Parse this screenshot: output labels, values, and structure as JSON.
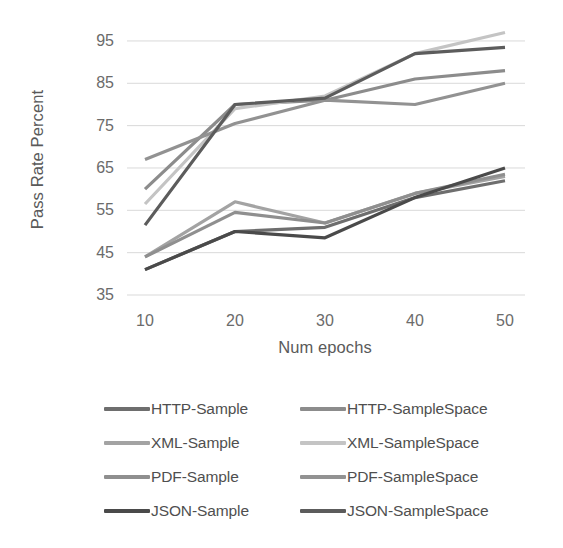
{
  "chart_data": {
    "type": "line",
    "title": "",
    "xlabel": "Num epochs",
    "ylabel": "Pass Rate Percent",
    "x": [
      10,
      20,
      30,
      40,
      50
    ],
    "xtick_labels": [
      "10",
      "20",
      "30",
      "40",
      "50"
    ],
    "ytick_labels": [
      "35",
      "45",
      "55",
      "65",
      "75",
      "85",
      "95"
    ],
    "yticks": [
      35,
      45,
      55,
      65,
      75,
      85,
      95
    ],
    "xlim": [
      10,
      50
    ],
    "ylim": [
      35,
      99
    ],
    "grid": "horizontal",
    "legend_position": "bottom",
    "legend_columns": 2,
    "series": [
      {
        "name": "HTTP-Sample",
        "color": "#6e6e6e",
        "values": [
          41,
          50,
          51,
          58,
          62
        ]
      },
      {
        "name": "HTTP-SampleSpace",
        "color": "#8c8c8c",
        "values": [
          60,
          80,
          81,
          86,
          88
        ]
      },
      {
        "name": "XML-Sample",
        "color": "#a3a3a3",
        "values": [
          44,
          57,
          52,
          59,
          63
        ]
      },
      {
        "name": "XML-SampleSpace",
        "color": "#c4c4c4",
        "values": [
          56.5,
          79,
          82,
          92,
          97
        ]
      },
      {
        "name": "PDF-Sample",
        "color": "#8f8f8f",
        "values": [
          44,
          54.5,
          52,
          59,
          63.5
        ]
      },
      {
        "name": "PDF-SampleSpace",
        "color": "#929292",
        "values": [
          67,
          75.5,
          81,
          80,
          85
        ]
      },
      {
        "name": "JSON-Sample",
        "color": "#4a4a4a",
        "values": [
          41,
          50,
          48.5,
          58,
          65
        ]
      },
      {
        "name": "JSON-SampleSpace",
        "color": "#5c5c5c",
        "values": [
          51.5,
          80,
          81.5,
          92,
          93.5
        ]
      }
    ]
  },
  "axes": {
    "x_title": "Num epochs",
    "y_title": "Pass Rate Percent"
  },
  "colors": {
    "background": "#ffffff",
    "gridline": "#d9d9d9",
    "tick_text": "#6b6b6b",
    "axis_title_text": "#5a5a5a",
    "legend_text": "#4f4f4f"
  },
  "legend": {
    "entries": [
      {
        "label": "HTTP-Sample",
        "color": "#6e6e6e"
      },
      {
        "label": "HTTP-SampleSpace",
        "color": "#8c8c8c"
      },
      {
        "label": "XML-Sample",
        "color": "#a3a3a3"
      },
      {
        "label": "XML-SampleSpace",
        "color": "#c4c4c4"
      },
      {
        "label": "PDF-Sample",
        "color": "#8f8f8f"
      },
      {
        "label": "PDF-SampleSpace",
        "color": "#929292"
      },
      {
        "label": "JSON-Sample",
        "color": "#4a4a4a"
      },
      {
        "label": "JSON-SampleSpace",
        "color": "#5c5c5c"
      }
    ]
  }
}
